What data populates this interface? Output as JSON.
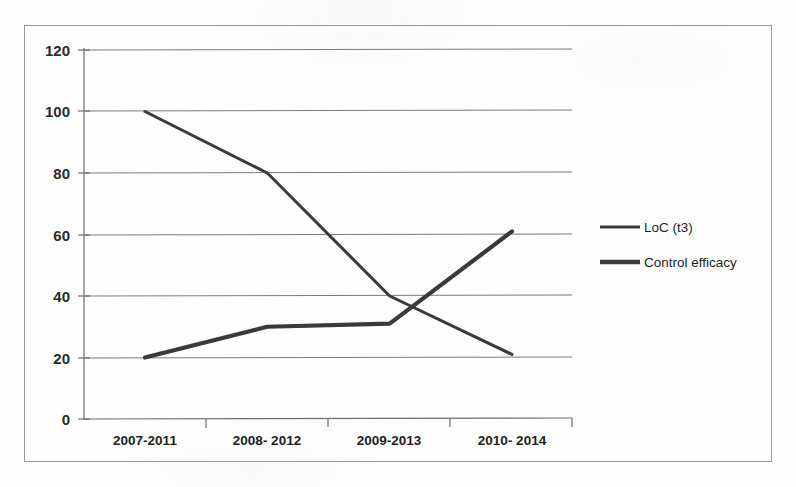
{
  "chart_data": {
    "type": "line",
    "title": "",
    "xlabel": "",
    "ylabel": "",
    "ylim": [
      0,
      120
    ],
    "ytick_labels": [
      "0",
      "20",
      "40",
      "60",
      "80",
      "100",
      "120"
    ],
    "yticks": [
      0,
      20,
      40,
      60,
      80,
      100,
      120
    ],
    "grid": true,
    "legend_position": "right",
    "categories": [
      "2007-2011",
      "2008- 2012",
      "2009-2013",
      "2010- 2014"
    ],
    "series": [
      {
        "name": "LoC (t3)",
        "values": [
          100,
          80,
          40,
          21
        ],
        "color": "#3a3a3a",
        "line_width": 3.0
      },
      {
        "name": "Control efficacy",
        "values": [
          20,
          30,
          31,
          61
        ],
        "color": "#3a3a3a",
        "line_width": 4.2
      }
    ]
  },
  "legend": {
    "items": [
      {
        "label": "LoC (t3)"
      },
      {
        "label": "Control efficacy"
      }
    ]
  },
  "colors": {
    "series_stroke": "#3a3a3a",
    "gridline": "#7b7b7b",
    "axis": "#6e6e6e",
    "frame_border": "#9a9a9a",
    "text": "#1f1f1f",
    "background": "#fefefe"
  }
}
